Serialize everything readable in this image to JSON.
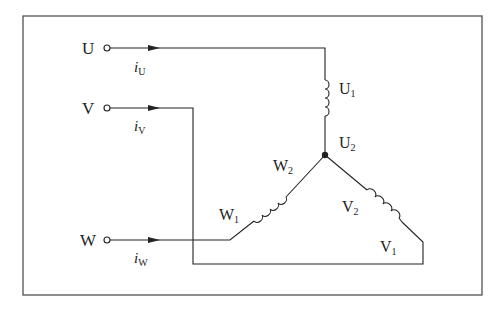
{
  "diagram": {
    "terminals": [
      {
        "id": "U",
        "label": "U",
        "current": "i",
        "current_sub": "U"
      },
      {
        "id": "V",
        "label": "V",
        "current": "i",
        "current_sub": "V"
      },
      {
        "id": "W",
        "label": "W",
        "current": "i",
        "current_sub": "W"
      }
    ],
    "windings": [
      {
        "phase": "U",
        "start": "U",
        "start_sub": "1",
        "end": "U",
        "end_sub": "2"
      },
      {
        "phase": "V",
        "start": "V",
        "start_sub": "1",
        "end": "V",
        "end_sub": "2"
      },
      {
        "phase": "W",
        "start": "W",
        "start_sub": "1",
        "end": "W",
        "end_sub": "2"
      }
    ],
    "neutral_point": "star junction of U2, V2, W2",
    "colors": {
      "line": "#222222",
      "background": "#ffffff",
      "frame": "#444444"
    }
  }
}
